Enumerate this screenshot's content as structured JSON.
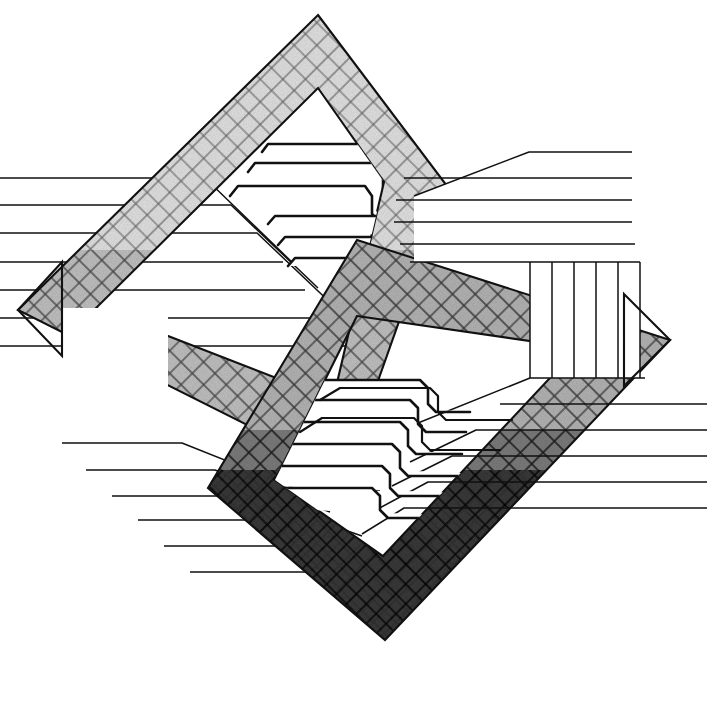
{
  "artwork": {
    "title": "Interlocking Diamond Bands with Stepped Ribbons",
    "medium": "pen-and-ink line drawing",
    "canvas": {
      "width": 707,
      "height": 728,
      "background": "#ffffff"
    },
    "stroke_color": "#111111",
    "composition": "Two large outlined diamonds (rotated squares) overlap near the centre; each diamond frame is filled with a stippled cross-hatch texture. Two wing panels extend left-up and right-down, each containing a fan of ruled horizontal lines and a block of vertical stripes. Inside each diamond sits a nest of stepped ribbon bands.",
    "symmetry": "approximate 180-degree rotational symmetry about the canvas centre"
  },
  "palette": {
    "ink": "#111111",
    "paper": "#ffffff",
    "texture_light": "#d9d9d9",
    "texture_mid": "#a8a8a8",
    "texture_dark": "#4a4a4a",
    "texture_darkest": "#2b2b2b"
  },
  "shapes": {
    "upper_diamond": {
      "name": "upper-diamond-frame",
      "apex_top": [
        318,
        15
      ],
      "apex_left": [
        18,
        310
      ],
      "apex_right": [
        447,
        186
      ],
      "apex_bottom": [
        345,
        474
      ],
      "band_width": 74,
      "texture": "cross-hatch-light",
      "tone": "#d9d9d9"
    },
    "lower_diamond": {
      "name": "lower-diamond-frame",
      "apex_top": [
        357,
        240
      ],
      "apex_left": [
        208,
        488
      ],
      "apex_right": [
        670,
        340
      ],
      "apex_bottom": [
        385,
        640
      ],
      "band_width": 74,
      "texture": "cross-hatch-dark",
      "tone": "#4a4a4a"
    },
    "left_wing": {
      "name": "left-wing-panel",
      "horizontal_line_count": 6,
      "vertical_stripe_count": 5,
      "description": "Upper-left panel of ruled horizontal lines meeting a diagonal edge, with a block of vertical stripes below."
    },
    "right_wing": {
      "name": "right-wing-panel",
      "horizontal_line_count": 6,
      "vertical_stripe_count": 5,
      "description": "Lower-right mirror of the left wing panel."
    },
    "upper_ribbons": {
      "name": "upper-ribbon-nest",
      "band_count": 6,
      "description": "Stepped tab-like ribbon bands nested inside the upper diamond, stepping up to the right."
    },
    "lower_ribbons": {
      "name": "lower-ribbon-nest",
      "band_count": 6,
      "description": "Stepped tab-like ribbon bands nested inside the lower diamond, stepping down to the left."
    }
  },
  "labels": {
    "none_visible": "This artwork contains no text, numerals, axis ticks, legend entries or captions."
  }
}
